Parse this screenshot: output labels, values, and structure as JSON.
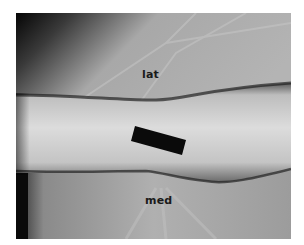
{
  "figure": {
    "labels": {
      "top": "lat",
      "bottom": "med"
    },
    "colors": {
      "border": "#ffffff",
      "background_sheet": "#a0a0a0",
      "skin": "#cfcfcf",
      "marker": "#0a0a0a",
      "label_text": "#1a1a1a"
    }
  }
}
